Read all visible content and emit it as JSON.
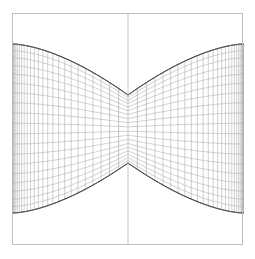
{
  "figure": {
    "background_color": "#ffffff",
    "width": 255,
    "height": 259
  },
  "frame": {
    "name": "outer-square-frame",
    "x": 12.5,
    "y": 13.5,
    "width": 230,
    "height": 231,
    "stroke_color": "#b9b9b9",
    "stroke_width": 0.9,
    "fill": "none"
  },
  "axis": {
    "name": "vertical-center-axis",
    "x": 128,
    "y_top": 13.5,
    "y_bottom": 244.5,
    "stroke_color": "#bdbdbd",
    "stroke_width": 0.9
  },
  "chart_data": {
    "type": "line",
    "subtitle": "",
    "xlabel": "",
    "ylabel": "",
    "grid": true,
    "legend_position": "none",
    "xlim": [
      -1,
      1
    ],
    "ylim": [
      -1,
      1
    ],
    "geometry": {
      "description": "Square domain mapped by a cusp-forming conformal map. Two boundary curves (upper and lower) sweep from the left and right frame edges inward and meet the vertical center axis at sharp cusp points. Interior is filled with a quadrilateral mesh of u-lines and v-lines.",
      "pixel_frame": {
        "left": 12.5,
        "top": 13.5,
        "right": 242.5,
        "bottom": 244.5
      },
      "center_x": 128,
      "cusp_upper": {
        "x": 128,
        "y": 95
      },
      "cusp_lower": {
        "x": 128,
        "y": 163
      },
      "boundary_left_top": {
        "x": 12.5,
        "y": 44
      },
      "boundary_right_top": {
        "x": 242.5,
        "y": 44
      },
      "boundary_left_bottom": {
        "x": 12.5,
        "y": 213
      },
      "boundary_right_bottom": {
        "x": 242.5,
        "y": 213
      },
      "mesh_u_lines": 26,
      "mesh_v_lines": 19,
      "cusp_exponent": 0.62,
      "pinch_strength": 0.86
    },
    "styles": {
      "mesh_stroke_color": "#a9a9a9",
      "mesh_stroke_width": 0.55,
      "boundary_stroke_color": "#4a4a4a",
      "boundary_stroke_width": 1.0,
      "center_dense_stroke_color": "#909090"
    },
    "series": [
      {
        "name": "upper-boundary-left",
        "values": [
          44,
          45,
          47,
          50,
          54,
          60,
          67,
          76,
          86,
          95
        ]
      },
      {
        "name": "upper-boundary-right",
        "values": [
          95,
          86,
          76,
          67,
          60,
          54,
          50,
          47,
          45,
          44
        ]
      },
      {
        "name": "lower-boundary-left",
        "values": [
          213,
          212,
          210,
          207,
          203,
          197,
          190,
          181,
          171,
          163
        ]
      },
      {
        "name": "lower-boundary-right",
        "values": [
          163,
          171,
          181,
          190,
          197,
          203,
          207,
          210,
          212,
          213
        ]
      }
    ],
    "x": [
      -1.0,
      -0.85,
      -0.7,
      -0.55,
      -0.4,
      -0.28,
      -0.18,
      -0.1,
      -0.04,
      0.0
    ]
  }
}
